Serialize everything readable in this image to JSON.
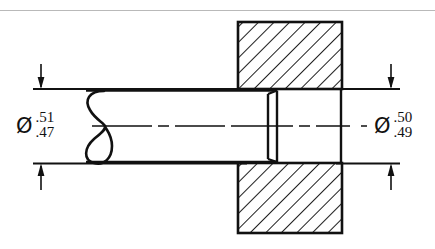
{
  "drawing": {
    "title": "Shaft and hole fit section drawing",
    "type": "engineering-section-drawing",
    "line_color": "#111111",
    "background_color": "#ffffff",
    "scan_line_color": "#b9b9b9"
  },
  "dimensions": {
    "left": {
      "name": "shaft-diameter",
      "symbol": "Ø",
      "upper_limit": ".51",
      "lower_limit": ".47"
    },
    "right": {
      "name": "hole-diameter",
      "symbol": "Ø",
      "upper_limit": ".50",
      "lower_limit": ".49"
    }
  },
  "features": {
    "break_symbol": "conventional-s-break",
    "section_hatch_angle_deg": 45,
    "centerline_style": "dash-dot",
    "block_label": "sectioned-plate",
    "shaft_label": "shaft"
  }
}
